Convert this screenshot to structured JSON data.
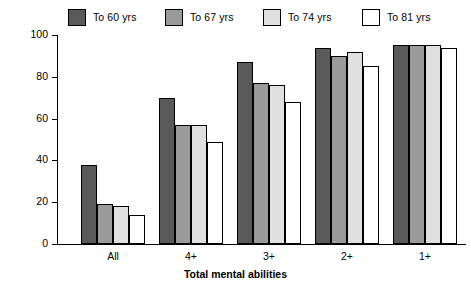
{
  "chart_data": {
    "type": "bar",
    "title": "",
    "xlabel": "Total mental abilities",
    "ylabel": "Percentage maintenance over 7 years",
    "categories": [
      "All",
      "4+",
      "3+",
      "2+",
      "1+"
    ],
    "ylim": [
      0,
      100
    ],
    "yticks": [
      0,
      20,
      40,
      60,
      80,
      100
    ],
    "grid": false,
    "legend_position": "top",
    "series": [
      {
        "name": "To 60 yrs",
        "color": "#595959",
        "values": [
          38,
          70,
          87,
          94,
          95
        ]
      },
      {
        "name": "To 67 yrs",
        "color": "#9a9a9a",
        "values": [
          19,
          57,
          77,
          90,
          95
        ]
      },
      {
        "name": "To 74 yrs",
        "color": "#e0e0e0",
        "values": [
          18,
          57,
          76,
          92,
          95
        ]
      },
      {
        "name": "To 81 yrs",
        "color": "#ffffff",
        "values": [
          14,
          49,
          68,
          85,
          94
        ]
      }
    ]
  }
}
